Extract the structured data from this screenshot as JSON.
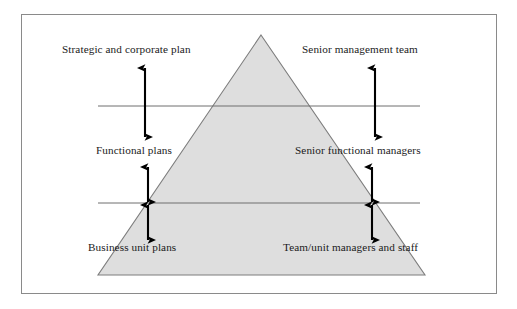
{
  "figure": {
    "type": "pyramid-hierarchy-diagram",
    "border_color": "#8a8a8a",
    "pyramid_fill": "#dedede",
    "pyramid_stroke": "#7d7d7d",
    "arrow_color": "#000000",
    "divider_color": "#6e6e6e"
  },
  "pyramid": {
    "apex": {
      "x": 261,
      "y": 35
    },
    "base_left": {
      "x": 98,
      "y": 275
    },
    "base_right": {
      "x": 425,
      "y": 275
    },
    "divider_lines_y": [
      106,
      203
    ]
  },
  "labels": {
    "left": [
      {
        "id": "strategic-plan",
        "text": "Strategic and corporate plan"
      },
      {
        "id": "functional-plans",
        "text": "Functional plans"
      },
      {
        "id": "business-unit-plans",
        "text": "Business unit plans"
      }
    ],
    "right": [
      {
        "id": "senior-management-team",
        "text": "Senior management team"
      },
      {
        "id": "senior-functional-managers",
        "text": "Senior functional managers"
      },
      {
        "id": "team-unit-managers",
        "text": "Team/unit managers and staff"
      }
    ]
  },
  "arrows": [
    {
      "id": "arrow-left-upper",
      "x": 145,
      "y1": 68,
      "y2": 137,
      "heads": "both"
    },
    {
      "id": "arrow-right-upper",
      "x": 375,
      "y1": 68,
      "y2": 137,
      "heads": "both"
    },
    {
      "id": "arrow-left-mid",
      "x": 148,
      "y1": 167,
      "y2": 202,
      "heads": "both"
    },
    {
      "id": "arrow-right-mid",
      "x": 372,
      "y1": 167,
      "y2": 202,
      "heads": "both"
    },
    {
      "id": "arrow-left-lower",
      "x": 148,
      "y1": 205,
      "y2": 240,
      "heads": "both"
    },
    {
      "id": "arrow-right-lower",
      "x": 372,
      "y1": 205,
      "y2": 240,
      "heads": "both"
    }
  ],
  "divider_lines": [
    {
      "id": "divider-upper",
      "x1": 98,
      "x2": 420,
      "y": 106
    },
    {
      "id": "divider-lower",
      "x1": 98,
      "x2": 420,
      "y": 203
    }
  ]
}
